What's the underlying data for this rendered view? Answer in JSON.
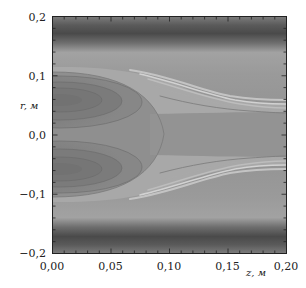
{
  "chart_data": {
    "type": "heatmap",
    "subtype": "filled-contour (grayscale)",
    "title": "",
    "xlabel": "z, м",
    "ylabel": "r, м",
    "xlim": [
      0.0,
      0.2
    ],
    "ylim": [
      -0.2,
      0.2
    ],
    "x_ticks": [
      "0,00",
      "0,05",
      "0,10",
      "0,15",
      "0,20"
    ],
    "y_ticks": [
      "0,2",
      "0,1",
      "0,0",
      "−0,1",
      "−0,2"
    ],
    "x_minor_tick_step": 0.01,
    "y_minor_tick_step": 0.02,
    "grid": false,
    "legend": null,
    "colormap": "grayscale (dark = low, light = high)",
    "features": [
      {
        "name": "outer dark band (top)",
        "r_range": [
          0.155,
          0.195
        ],
        "z_range": [
          0.0,
          0.2
        ],
        "shade": "darkest"
      },
      {
        "name": "outer dark band (bottom)",
        "r_range": [
          -0.195,
          -0.155
        ],
        "z_range": [
          0.0,
          0.2
        ],
        "shade": "darkest"
      },
      {
        "name": "upper lobe (local minimum)",
        "center": [
          0.02,
          0.055
        ],
        "extent_z": [
          0.0,
          0.09
        ],
        "shade": "medium-dark"
      },
      {
        "name": "lower lobe (local minimum)",
        "center": [
          0.02,
          -0.055
        ],
        "extent_z": [
          0.0,
          0.09
        ],
        "shade": "medium-dark"
      },
      {
        "name": "central plateau",
        "boundary_z": 0.1,
        "r_range": [
          -0.1,
          0.1
        ],
        "shade": "medium"
      },
      {
        "name": "diverging bright contour lines (upper)",
        "from": [
          0.07,
          0.1
        ],
        "to": [
          0.2,
          0.04
        ],
        "shade": "light"
      },
      {
        "name": "diverging bright contour lines (lower)",
        "from": [
          0.07,
          -0.1
        ],
        "to": [
          0.2,
          -0.04
        ],
        "shade": "light"
      },
      {
        "name": "central channel",
        "z_range": [
          0.1,
          0.2
        ],
        "r_range": [
          -0.04,
          0.04
        ],
        "shade": "medium"
      }
    ],
    "colors": {
      "darkest": "#4a4a4a",
      "dark": "#6a6a6a",
      "medium": "#8e8e8e",
      "light": "#b4b4b4",
      "lightest": "#d0d0d0"
    }
  }
}
